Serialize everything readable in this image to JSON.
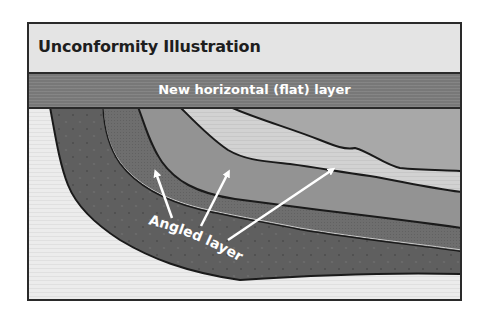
{
  "diagram": {
    "title": "Unconformity Illustration",
    "flat_layer_label": "New horizontal (flat) layer",
    "angled_layers_label": "Angled layers",
    "arrows": [
      {
        "from": [
          172,
          218
        ],
        "to": [
          155,
          170
        ]
      },
      {
        "from": [
          201,
          226
        ],
        "to": [
          229,
          170
        ]
      },
      {
        "from": [
          228,
          240
        ],
        "to": [
          335,
          168
        ]
      }
    ],
    "layers": [
      {
        "name": "background",
        "color": "#ececec"
      },
      {
        "name": "angled-layer-1-outer",
        "color": "#5f5f5f"
      },
      {
        "name": "angled-layer-2",
        "color": "#6e6e6e"
      },
      {
        "name": "angled-layer-3",
        "color": "#939393"
      },
      {
        "name": "angled-layer-4-light",
        "color": "#d2d2d2"
      },
      {
        "name": "angled-layer-5-top",
        "color": "#a8a8a8"
      },
      {
        "name": "horizontal-flat-layer",
        "color": "#7e7e7e"
      }
    ]
  }
}
